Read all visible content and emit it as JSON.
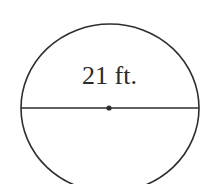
{
  "diagram": {
    "shape": "circle",
    "diameter_label": "21 ft.",
    "diameter_value": 21,
    "unit": "ft.",
    "show_center_point": true,
    "colors": {
      "stroke": "#2e2e2e",
      "background": "#ffffff"
    }
  }
}
